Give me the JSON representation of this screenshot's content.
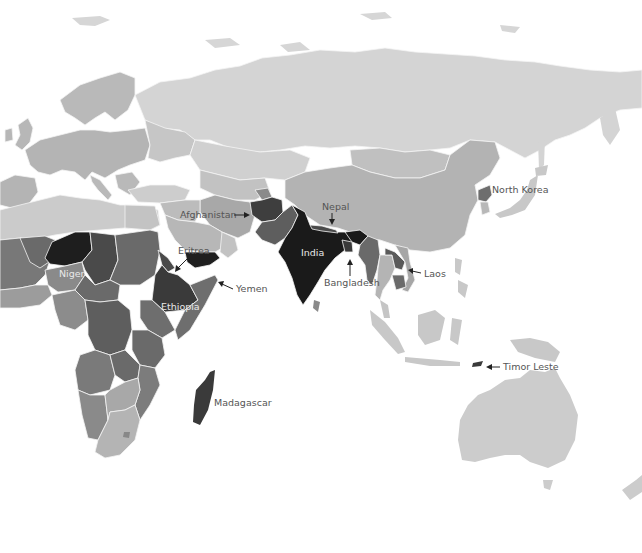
{
  "map": {
    "type": "choropleth",
    "palette": {
      "background": "#ffffff",
      "very_light": "#d9d9d9",
      "light": "#c8c8c8",
      "medium_light": "#b0b0b0",
      "medium": "#8e8e8e",
      "medium_dark": "#6e6e6e",
      "dark": "#4a4a4a",
      "very_dark": "#1e1e1e"
    },
    "labels": [
      {
        "id": "afghanistan",
        "text": "Afghanistan",
        "position": "left",
        "arrow": true
      },
      {
        "id": "nepal",
        "text": "Nepal",
        "position": "above",
        "arrow": true
      },
      {
        "id": "north-korea",
        "text": "North Korea",
        "position": "right",
        "arrow": false
      },
      {
        "id": "eritrea",
        "text": "Eritrea",
        "position": "above",
        "arrow": true
      },
      {
        "id": "niger",
        "text": "Niger",
        "position": "inside",
        "arrow": false
      },
      {
        "id": "india",
        "text": "India",
        "position": "inside",
        "arrow": false
      },
      {
        "id": "yemen",
        "text": "Yemen",
        "position": "right",
        "arrow": true
      },
      {
        "id": "ethiopia",
        "text": "Ethiopia",
        "position": "inside",
        "arrow": false
      },
      {
        "id": "bangladesh",
        "text": "Bangladesh",
        "position": "below",
        "arrow": true
      },
      {
        "id": "laos",
        "text": "Laos",
        "position": "right",
        "arrow": true
      },
      {
        "id": "timor-leste",
        "text": "Timor Leste",
        "position": "right",
        "arrow": true
      },
      {
        "id": "madagascar",
        "text": "Madagascar",
        "position": "right",
        "arrow": false
      }
    ],
    "shading": {
      "very_dark": [
        "India",
        "Niger",
        "Yemen"
      ],
      "dark": [
        "Afghanistan",
        "Ethiopia",
        "Madagascar",
        "Eritrea",
        "Timor Leste",
        "Chad",
        "Nepal",
        "Bangladesh"
      ],
      "medium_dark": [
        "North Korea",
        "Laos",
        "Cambodia",
        "Myanmar",
        "Pakistan",
        "Sudan",
        "DR Congo",
        "Somalia",
        "Kenya",
        "Tanzania",
        "Zambia",
        "Mali",
        "Central African Republic"
      ],
      "medium": [
        "Angola",
        "Mozambique",
        "Namibia",
        "Nigeria",
        "Tajikistan"
      ],
      "medium_light": [
        "China",
        "Europe",
        "Iran",
        "Saudi Arabia",
        "Botswana",
        "South Africa",
        "Zimbabwe",
        "Mongolia"
      ],
      "light": [
        "Russia",
        "Kazakhstan",
        "Australia",
        "Indonesia",
        "Papua New Guinea",
        "Japan",
        "Turkey",
        "Algeria",
        "Libya",
        "Egypt",
        "Thailand",
        "Philippines"
      ]
    }
  }
}
